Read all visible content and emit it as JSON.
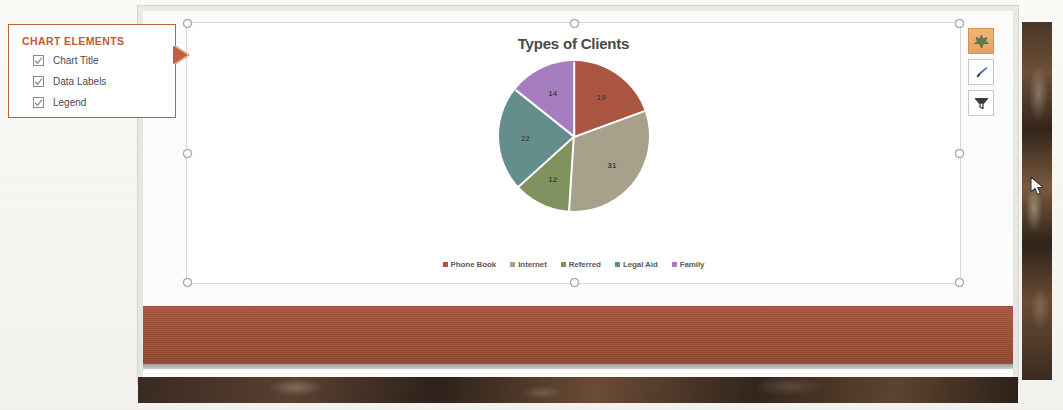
{
  "callout": {
    "title": "CHART ELEMENTS",
    "items": [
      {
        "label": "Chart Title",
        "checked": true
      },
      {
        "label": "Data Labels",
        "checked": true
      },
      {
        "label": "Legend",
        "checked": true
      }
    ]
  },
  "chart_buttons": [
    {
      "name": "chart-elements-button",
      "icon": "plus-icon",
      "active": true
    },
    {
      "name": "chart-styles-button",
      "icon": "paintbrush-icon",
      "active": false
    },
    {
      "name": "chart-filters-button",
      "icon": "funnel-icon",
      "active": false
    }
  ],
  "ghost_text": [
    {
      "text": "through with this. Then think about",
      "x": 196,
      "y": 122,
      "size": 19
    },
    {
      "text": "should the client's money or property.",
      "x": 604,
      "y": 122,
      "size": 19
    },
    {
      "text": "about the client's thoughts and the",
      "x": 196,
      "y": 152,
      "size": 19
    },
    {
      "text": "court costs and attorney's fees are",
      "x": 604,
      "y": 152,
      "size": 19
    },
    {
      "text": "client will have the responsibility",
      "x": 196,
      "y": 182,
      "size": 19
    },
    {
      "text": "to provide as the case may require.",
      "x": 604,
      "y": 182,
      "size": 19
    }
  ],
  "chart_data": {
    "type": "pie",
    "title": "Types of Clients",
    "categories": [
      "Phone Book",
      "Internet",
      "Referred",
      "Legal Aid",
      "Family"
    ],
    "values": [
      19,
      31,
      12,
      22,
      14
    ],
    "labels": [
      "19",
      "31",
      "12",
      "22",
      "14"
    ],
    "colors": [
      "#b0543f",
      "#a8a088",
      "#7e9359",
      "#618f8c",
      "#a87cc3"
    ],
    "legend_position": "bottom",
    "show_data_labels": true,
    "show_title": true,
    "show_legend": true
  },
  "theme": {
    "accent": "#bf5b37",
    "band": "#9d4f39",
    "highlight": "#e7a261"
  }
}
